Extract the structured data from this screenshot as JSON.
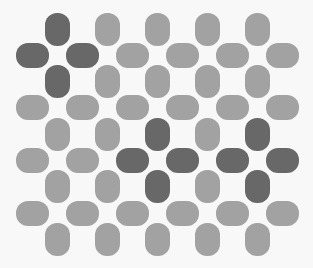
{
  "game": {
    "type": "pill-grid-puzzle",
    "colors": {
      "background": "#f8f8f8",
      "light_piece": "#a2a2a2",
      "dark_piece": "#686868"
    },
    "vertical_pieces": {
      "x_centers": [
        57,
        107,
        157,
        207,
        257
      ],
      "y_centers": [
        29,
        81,
        134,
        186,
        239
      ],
      "rows": [
        [
          "dark",
          "light",
          "light",
          "light",
          "light"
        ],
        [
          "dark",
          "light",
          "light",
          "light",
          "light"
        ],
        [
          "light",
          "light",
          "dark",
          "light",
          "dark"
        ],
        [
          "light",
          "light",
          "dark",
          "light",
          "dark"
        ],
        [
          "light",
          "light",
          "light",
          "light",
          "light"
        ]
      ]
    },
    "horizontal_pieces": {
      "x_centers": [
        32,
        82,
        132,
        182,
        232,
        282
      ],
      "y_centers": [
        55,
        107,
        160,
        213
      ],
      "rows": [
        [
          "dark",
          "dark",
          "light",
          "light",
          "light",
          "light"
        ],
        [
          "light",
          "light",
          "light",
          "light",
          "light",
          "light"
        ],
        [
          "light",
          "light",
          "dark",
          "dark",
          "dark",
          "dark"
        ],
        [
          "light",
          "light",
          "light",
          "light",
          "light",
          "light"
        ]
      ]
    }
  }
}
